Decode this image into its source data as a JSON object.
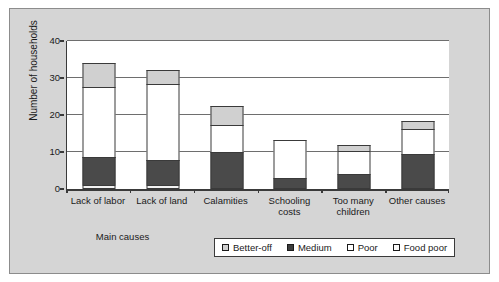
{
  "chart_data": {
    "type": "bar",
    "subtype": "stacked-bar",
    "title": "",
    "xlabel": "Main causes",
    "ylabel": "Number of households",
    "ylim": [
      0,
      40
    ],
    "yticks": [
      0,
      10,
      20,
      30,
      40
    ],
    "grid": true,
    "legend_position": "bottom-right",
    "categories": [
      "Lack of labor",
      "Lack of land",
      "Calamities",
      "Schooling costs",
      "Too many children",
      "Other causes"
    ],
    "series": [
      {
        "name": "Food poor",
        "color": "#f2f2f2",
        "values": [
          1,
          1,
          0,
          0,
          0,
          0
        ]
      },
      {
        "name": "Medium",
        "color": "#4a4a4a",
        "values": [
          8,
          7,
          10,
          3,
          4,
          9.5
        ]
      },
      {
        "name": "Poor",
        "color": "#ffffff",
        "values": [
          19,
          21,
          7.5,
          10.5,
          6.5,
          7
        ]
      },
      {
        "name": "Better-off",
        "color": "#d0d0d0",
        "values": [
          7,
          4,
          5.5,
          0,
          2,
          2.5
        ]
      }
    ],
    "totals": [
      35,
      33,
      23,
      13.5,
      12.5,
      19
    ],
    "stack_order_bottom_to_top": [
      "Food poor",
      "Medium",
      "Poor",
      "Better-off"
    ]
  },
  "axes": {
    "y_title": "Number of households",
    "y_ticks": [
      "0",
      "10",
      "20",
      "30",
      "40"
    ],
    "x_title": "Main causes",
    "x_labels": [
      [
        "Lack of labor"
      ],
      [
        "Lack of land"
      ],
      [
        "Calamities"
      ],
      [
        "Schooling",
        "costs"
      ],
      [
        "Too many",
        "children"
      ],
      [
        "Other causes"
      ]
    ]
  },
  "legend": {
    "items": [
      {
        "label": "Better-off",
        "swatch": "better-off"
      },
      {
        "label": "Medium",
        "swatch": "medium"
      },
      {
        "label": "Poor",
        "swatch": "poor"
      },
      {
        "label": "Food poor",
        "swatch": "food-poor"
      }
    ]
  },
  "colors": {
    "panel_background": "#d5d5d5",
    "plot_background": "#ffffff",
    "axis": "#3a3a3a",
    "gridline": "#6e6e6e",
    "better_off": "#d0d0d0",
    "medium": "#4a4a4a",
    "poor": "#ffffff",
    "food_poor": "#f2f2f2"
  }
}
